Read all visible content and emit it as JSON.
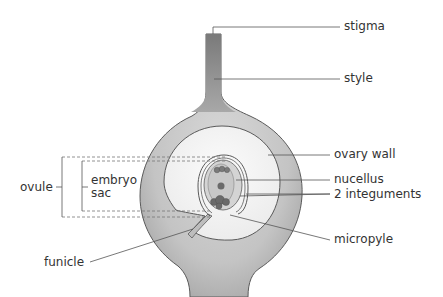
{
  "diagram": {
    "type": "labelled-biology-diagram",
    "labels": {
      "stigma": "stigma",
      "style": "style",
      "ovary_wall": "ovary wall",
      "nucellus": "nucellus",
      "integuments": "2 integuments",
      "micropyle": "micropyle",
      "funicle": "funicle",
      "ovule": "ovule",
      "embryo_sac_line1": "embryo",
      "embryo_sac_line2": "sac"
    },
    "colors": {
      "style_fill": "#8c8c8c",
      "ovary_wall_fill": "#bdbdbd",
      "cavity_fill": "#f2f2f2",
      "nucellus_fill": "#d2d2d2",
      "embryo_sac_fill": "#c4c4c4",
      "nuclei_fill": "#6e6e6e",
      "outline": "#555555",
      "leader_line": "#555555"
    }
  }
}
